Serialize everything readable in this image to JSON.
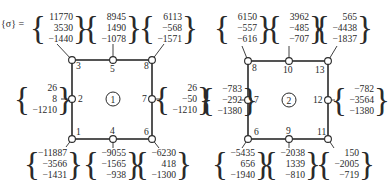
{
  "title_label": "{σ} =",
  "elements": [
    {
      "id": "1",
      "center": [
        113,
        99
      ],
      "box": [
        72,
        60,
        152,
        139
      ],
      "nodes": [
        {
          "n": "1",
          "x": 72,
          "y": 139,
          "label_dx": 4,
          "label_dy": -4,
          "vec": [
            "−11887",
            "−3566",
            "−1431"
          ],
          "vx": 30,
          "vy": 148,
          "lead": [
            66,
            147
          ]
        },
        {
          "n": "2",
          "x": 72,
          "y": 99,
          "label_dx": 6,
          "label_dy": 3,
          "vec": [
            "26",
            "8",
            "−1210"
          ],
          "vx": 20,
          "vy": 83,
          "lead": [
            61,
            99
          ]
        },
        {
          "n": "3",
          "x": 72,
          "y": 60,
          "label_dx": 4,
          "label_dy": 9,
          "vec": [
            "11770",
            "3530",
            "−1440"
          ],
          "vx": 36,
          "vy": 12,
          "lead": [
            57,
            44
          ]
        },
        {
          "n": "4",
          "x": 113,
          "y": 139,
          "label_dx": -3,
          "label_dy": -5,
          "vec": [
            "−9055",
            "−1565",
            "−938"
          ],
          "vx": 89,
          "vy": 148,
          "lead": [
            113,
            148
          ]
        },
        {
          "n": "5",
          "x": 113,
          "y": 60,
          "label_dx": -3,
          "label_dy": 12,
          "vec": [
            "8945",
            "1490",
            "−1078"
          ],
          "vx": 89,
          "vy": 12,
          "lead": [
            113,
            44
          ]
        },
        {
          "n": "6",
          "x": 152,
          "y": 139,
          "label_dx": -8,
          "label_dy": -4,
          "vec": [
            "−6230",
            "418",
            "−1300"
          ],
          "vx": 139,
          "vy": 148,
          "lead": [
            159,
            148
          ]
        },
        {
          "n": "7",
          "x": 152,
          "y": 99,
          "label_dx": -10,
          "label_dy": 3,
          "vec": [
            "26",
            "−50",
            "−1210"
          ],
          "vx": 160,
          "vy": 83,
          "lead": [
            160,
            99
          ]
        },
        {
          "n": "8",
          "x": 152,
          "y": 60,
          "label_dx": -8,
          "label_dy": 9,
          "vec": [
            "6113",
            "−568",
            "−1571"
          ],
          "vx": 145,
          "vy": 12,
          "lead": [
            164,
            44
          ]
        }
      ]
    },
    {
      "id": "2",
      "center": [
        289,
        100
      ],
      "box": [
        248,
        61,
        328,
        139
      ],
      "nodes": [
        {
          "n": "6",
          "x": 248,
          "y": 139,
          "label_dx": 6,
          "label_dy": -4,
          "vec": [
            "−5435",
            "656",
            "−1940"
          ],
          "vx": 218,
          "vy": 148,
          "lead": [
            242,
            148
          ]
        },
        {
          "n": "7",
          "x": 248,
          "y": 100,
          "label_dx": 6,
          "label_dy": 3,
          "vec": [
            "−783",
            "−292",
            "−1380"
          ],
          "vx": 205,
          "vy": 84,
          "lead": [
            240,
            100
          ]
        },
        {
          "n": "8",
          "x": 248,
          "y": 61,
          "label_dx": 4,
          "label_dy": 10,
          "vec": [
            "6150",
            "−557",
            "−616"
          ],
          "vx": 220,
          "vy": 12,
          "lead": [
            242,
            46
          ]
        },
        {
          "n": "9",
          "x": 289,
          "y": 139,
          "label_dx": -3,
          "label_dy": -5,
          "vec": [
            "−2038",
            "1339",
            "−810"
          ],
          "vx": 268,
          "vy": 148,
          "lead": [
            289,
            148
          ]
        },
        {
          "n": "10",
          "x": 289,
          "y": 61,
          "label_dx": -6,
          "label_dy": 12,
          "vec": [
            "3962",
            "−485",
            "−707"
          ],
          "vx": 272,
          "vy": 12,
          "lead": [
            289,
            46
          ]
        },
        {
          "n": "11",
          "x": 328,
          "y": 139,
          "label_dx": -11,
          "label_dy": -4,
          "vec": [
            "150",
            "−2005",
            "−719"
          ],
          "vx": 322,
          "vy": 148,
          "lead": [
            334,
            148
          ]
        },
        {
          "n": "12",
          "x": 328,
          "y": 100,
          "label_dx": -15,
          "label_dy": 3,
          "vec": [
            "−782",
            "−3564",
            "−1380"
          ],
          "vx": 337,
          "vy": 84,
          "lead": [
            335,
            100
          ]
        },
        {
          "n": "13",
          "x": 328,
          "y": 61,
          "label_dx": -13,
          "label_dy": 12,
          "vec": [
            "565",
            "−4438",
            "−1837"
          ],
          "vx": 320,
          "vy": 12,
          "lead": [
            337,
            46
          ]
        }
      ]
    }
  ],
  "colors": {
    "ink": "#2a2a2a",
    "paper": "#ffffff"
  }
}
